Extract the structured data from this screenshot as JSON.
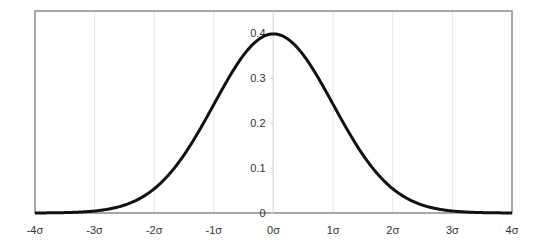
{
  "chart_data": {
    "type": "line",
    "title": "",
    "xlabel": "",
    "ylabel": "",
    "x_tick_labels": [
      "-4σ",
      "-3σ",
      "-2σ",
      "-1σ",
      "0σ",
      "1σ",
      "2σ",
      "3σ",
      "4σ"
    ],
    "x_ticks": [
      -4,
      -3,
      -2,
      -1,
      0,
      1,
      2,
      3,
      4
    ],
    "y_tick_labels": [
      "0",
      "0.1",
      "0.2",
      "0.3",
      "0.4"
    ],
    "y_ticks": [
      0,
      0.1,
      0.2,
      0.3,
      0.4
    ],
    "xlim": [
      -4,
      4
    ],
    "ylim": [
      0,
      0.45
    ],
    "grid": {
      "vertical": true,
      "horizontal": false
    },
    "legend": null,
    "series": [
      {
        "name": "normal pdf",
        "color": "#111111",
        "x": [
          -4,
          -3.5,
          -3,
          -2.5,
          -2,
          -1.5,
          -1,
          -0.5,
          0,
          0.5,
          1,
          1.5,
          2,
          2.5,
          3,
          3.5,
          4
        ],
        "values": [
          0.0001,
          0.0009,
          0.0044,
          0.0175,
          0.054,
          0.1295,
          0.242,
          0.3521,
          0.3989,
          0.3521,
          0.242,
          0.1295,
          0.054,
          0.0175,
          0.0044,
          0.0009,
          0.0001
        ]
      }
    ]
  },
  "colors": {
    "curve": "#111111",
    "frame": "#8a8a8a",
    "grid": "#e6e6e6",
    "text": "#333333"
  }
}
